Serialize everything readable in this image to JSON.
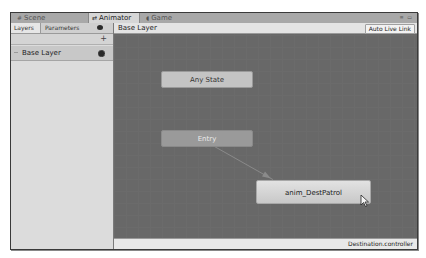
{
  "window": {
    "tabs": [
      {
        "label": "Scene",
        "icon": "scene-icon",
        "active": false
      },
      {
        "label": "Animator",
        "icon": "animator-icon",
        "active": true
      },
      {
        "label": "Game",
        "icon": "game-icon",
        "active": false
      }
    ],
    "controls": "≡ ▭"
  },
  "left_panel": {
    "tabs": [
      {
        "label": "Layers",
        "active": true
      },
      {
        "label": "Parameters",
        "active": false
      }
    ],
    "add_label": "+",
    "layers": [
      {
        "label": "Base Layer"
      }
    ]
  },
  "graph": {
    "breadcrumb": "Base Layer",
    "auto_live_link_label": "Auto Live Link",
    "states": [
      {
        "name": "Any State",
        "type": "any"
      },
      {
        "name": "Entry",
        "type": "entry"
      },
      {
        "name": "anim_DestPatrol",
        "type": "default"
      }
    ]
  },
  "statusbar": {
    "file": "Destination.controller"
  },
  "colors": {
    "graph_bg": "#686868",
    "default_state": "#d4d4d4",
    "entry_state": "#9a9a9a",
    "any_state": "#c4c4c4"
  }
}
